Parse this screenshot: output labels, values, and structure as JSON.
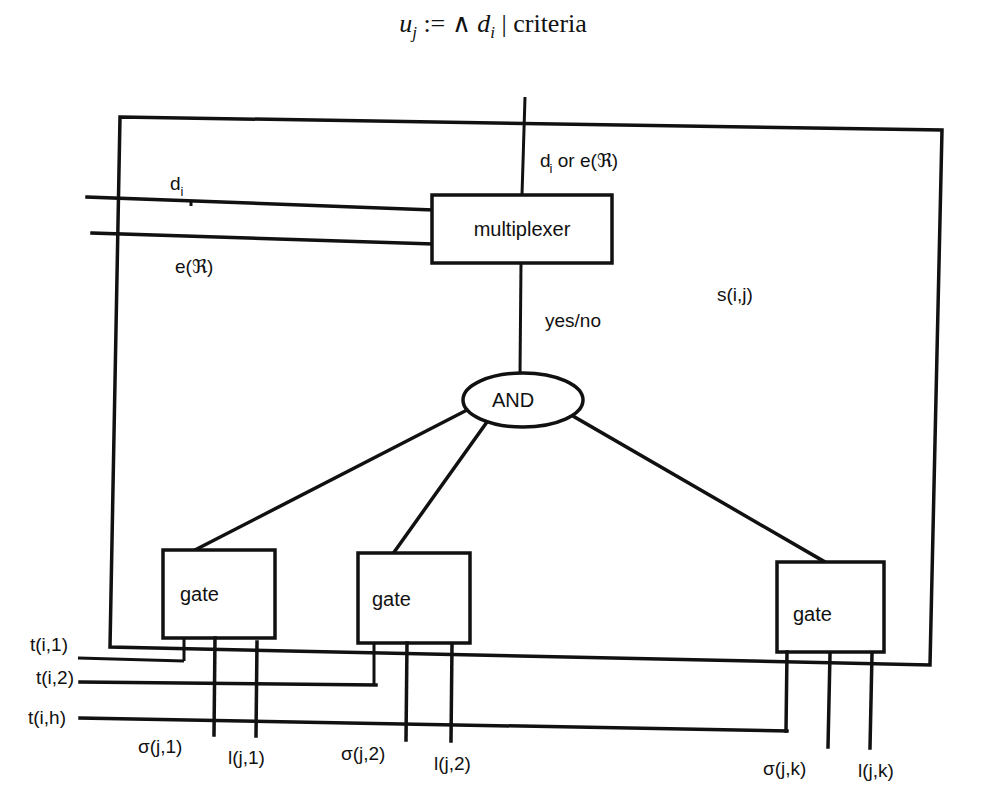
{
  "formula": {
    "lhs_var": "u",
    "lhs_sub": "j",
    "op": " := ∧ ",
    "rhs_var": "d",
    "rhs_sub": "i",
    "tail": " | criteria"
  },
  "diagram": {
    "container_label": "s(i,j)",
    "top_output_label_var": "d",
    "top_output_label_sub": "i",
    "top_output_label_rest": " or e(ℜ)",
    "input_d_var": "d",
    "input_d_sub": "i",
    "input_e_label": "e(ℜ)",
    "multiplexer_label": "multiplexer",
    "mux_to_and_label": "yes/no",
    "and_label": "AND",
    "gates": [
      {
        "label": "gate",
        "sigma_label": "σ(j,1)",
        "l_label": "l(j,1)"
      },
      {
        "label": "gate",
        "sigma_label": "σ(j,2)",
        "l_label": "l(j,2)"
      },
      {
        "label": "gate",
        "sigma_label": "σ(j,k)",
        "l_label": "l(j,k)"
      }
    ],
    "t_inputs": [
      "t(i,1)",
      "t(i,2)",
      "t(i,h)"
    ]
  }
}
